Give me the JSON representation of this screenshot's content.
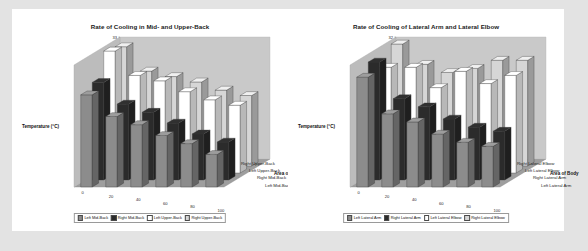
{
  "page": {
    "background": "#e3e3e3",
    "paper_background": "#ffffff"
  },
  "series_colors": [
    "#8c8c8c",
    "#2b2b2b",
    "#ffffff",
    "#d6d6d6"
  ],
  "axis_titles": {
    "y": "Temperature (°C)",
    "x": "Number of Swings",
    "z": "Area of Body"
  },
  "charts": [
    {
      "id": "mid-upper-back",
      "title": "Rate of Cooling in Mid- and Upper-Back",
      "chart_data": {
        "type": "bar",
        "title": "Rate of Cooling in Mid- and Upper-Back",
        "xlabel": "Number of Swings",
        "ylabel": "Temperature (°C)",
        "zlabel": "Area of Body",
        "categories": [
          "0",
          "20",
          "40",
          "60",
          "80",
          "100"
        ],
        "ylim": [
          28.5,
          33
        ],
        "yticks": [
          "33",
          "32.5",
          "32",
          "31.5",
          "31",
          "30.5",
          "30",
          "29.5",
          "29",
          "28.5"
        ],
        "zcategories": [
          "Left Mid-Back",
          "Right Mid-Back",
          "Left Upper-Back",
          "Right Upper-Back"
        ],
        "grid": false,
        "legend": "bottom",
        "series": [
          {
            "name": "Left Mid-Back",
            "values": [
              31.9,
              31.1,
              30.8,
              30.4,
              30.1,
              29.7
            ]
          },
          {
            "name": "Right Mid-Back",
            "values": [
              32.1,
              31.3,
              31.0,
              30.6,
              30.2,
              29.9
            ]
          },
          {
            "name": "Left Upper-Back",
            "values": [
              33.0,
              32.1,
              31.9,
              31.5,
              31.2,
              31.0
            ]
          },
          {
            "name": "Right Upper-Back",
            "values": [
              32.9,
              32.0,
              31.8,
              31.6,
              31.3,
              31.1
            ]
          }
        ]
      }
    },
    {
      "id": "lateral-arm-elbow",
      "title": "Rate of Cooling of Lateral Arm and Lateral Elbow",
      "chart_data": {
        "type": "bar",
        "title": "Rate of Cooling of Lateral Arm and Lateral Elbow",
        "xlabel": "Number of Swings",
        "ylabel": "Temperature (°C)",
        "zlabel": "Area of Body",
        "categories": [
          "0",
          "20",
          "40",
          "60",
          "80",
          "100"
        ],
        "ylim": [
          29,
          32
        ],
        "yticks": [
          "32",
          "31.5",
          "31",
          "30.5",
          "30",
          "29.5",
          "29"
        ],
        "zcategories": [
          "Left Lateral Arm",
          "Right Lateral Arm",
          "Left Lateral Elbow",
          "Right Lateral Elbow"
        ],
        "grid": false,
        "legend": "bottom",
        "series": [
          {
            "name": "Left Lateral Arm",
            "values": [
              31.7,
              30.8,
              30.6,
              30.3,
              30.1,
              30.0
            ]
          },
          {
            "name": "Right Lateral Arm",
            "values": [
              31.9,
              31.0,
              30.8,
              30.5,
              30.3,
              30.2
            ]
          },
          {
            "name": "Left Lateral Elbow",
            "values": [
              31.6,
              31.6,
              31.1,
              31.5,
              31.2,
              31.4
            ]
          },
          {
            "name": "Right Lateral Elbow",
            "values": [
              32.0,
              31.5,
              31.3,
              31.4,
              31.6,
              31.6
            ]
          }
        ]
      }
    }
  ]
}
